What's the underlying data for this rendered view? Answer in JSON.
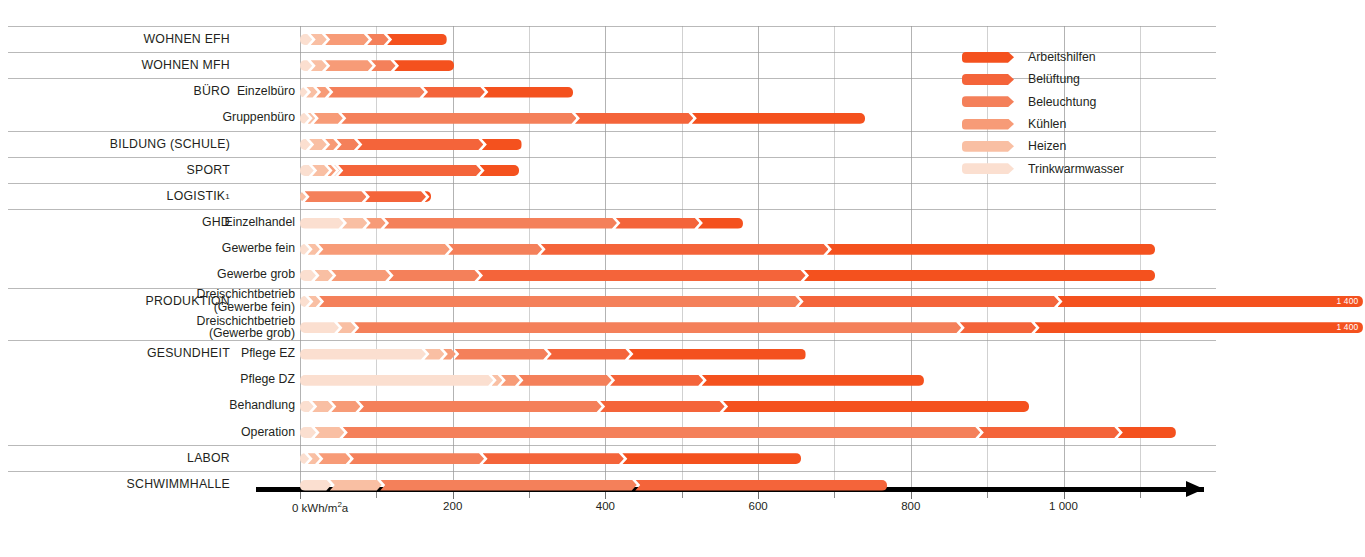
{
  "axis": {
    "unit_label": "0 kWh/m²a",
    "ticks": [
      {
        "value": 0,
        "label": "0 kWh/m²a"
      },
      {
        "value": 200,
        "label": "200"
      },
      {
        "value": 400,
        "label": "400"
      },
      {
        "value": 600,
        "label": "600"
      },
      {
        "value": 800,
        "label": "800"
      },
      {
        "value": 1000,
        "label": "1 000"
      }
    ],
    "minor_ticks": [
      100,
      300,
      500,
      700,
      900,
      1100
    ],
    "xmin": 0,
    "xmax": 1180
  },
  "legend": {
    "position": "top-right",
    "items": [
      {
        "label": "Arbeitshilfen",
        "color": "#f4511e"
      },
      {
        "label": "Belüftung",
        "color": "#f4643a"
      },
      {
        "label": "Beleuchtung",
        "color": "#f4805a"
      },
      {
        "label": "Kühlen",
        "color": "#f79b77"
      },
      {
        "label": "Heizen",
        "color": "#f9bfa3"
      },
      {
        "label": "Trinkwarmwasser",
        "color": "#fbdfd0"
      }
    ]
  },
  "chart_data": {
    "type": "bar",
    "orientation": "horizontal",
    "stacked": true,
    "title": "",
    "xlabel": "0 kWh/m²a",
    "ylabel": "",
    "xlim": [
      0,
      1180
    ],
    "grid": true,
    "series": [
      {
        "name": "Trinkwarmwasser",
        "color": "#fbdfd0"
      },
      {
        "name": "Heizen",
        "color": "#f9bfa3"
      },
      {
        "name": "Kühlen",
        "color": "#f79b77"
      },
      {
        "name": "Beleuchtung",
        "color": "#f4805a"
      },
      {
        "name": "Belüftung",
        "color": "#f4643a"
      },
      {
        "name": "Arbeitshilfen",
        "color": "#f4511e"
      }
    ],
    "rows": [
      {
        "group": "WOHNEN EFH",
        "sub": "",
        "sep": true,
        "values": {
          "Trinkwarmwasser": 16,
          "Heizen": 21,
          "Kühlen": 57,
          "Beleuchtung": 28,
          "Belüftung": 0,
          "Arbeitshilfen": 78
        },
        "total": 200,
        "total_label": ""
      },
      {
        "group": "WOHNEN MFH",
        "sub": "",
        "sep": true,
        "values": {
          "Trinkwarmwasser": 16,
          "Heizen": 21,
          "Kühlen": 62,
          "Beleuchtung": 32,
          "Belüftung": 0,
          "Arbeitshilfen": 79
        },
        "total": 210,
        "total_label": ""
      },
      {
        "group": "BÜRO",
        "sub": "Einzelbüro",
        "sep": true,
        "values": {
          "Trinkwarmwasser": 10,
          "Heizen": 15,
          "Kühlen": 18,
          "Beleuchtung": 126,
          "Belüftung": 81,
          "Arbeitshilfen": 118
        },
        "total": 368,
        "total_label": ""
      },
      {
        "group": "",
        "sub": "Gruppenbüro",
        "sep": false,
        "values": {
          "Trinkwarmwasser": 12,
          "Heizen": 10,
          "Kühlen": 38,
          "Beleuchtung": 308,
          "Belüftung": 155,
          "Arbeitshilfen": 227
        },
        "total": 750,
        "total_label": ""
      },
      {
        "group": "BILDUNG (SCHULE)",
        "sub": "",
        "sep": true,
        "values": {
          "Trinkwarmwasser": 14,
          "Heizen": 23,
          "Kühlen": 17,
          "Beleuchtung": 29,
          "Belüftung": 165,
          "Arbeitshilfen": 52
        },
        "total": 300,
        "total_label": ""
      },
      {
        "group": "SPORT",
        "sub": "",
        "sep": true,
        "values": {
          "Trinkwarmwasser": 18,
          "Heizen": 22,
          "Kühlen": 11,
          "Beleuchtung": 7,
          "Belüftung": 187,
          "Arbeitshilfen": 52
        },
        "total": 297,
        "total_label": ""
      },
      {
        "group": "LOGISTIK¹",
        "sub": "",
        "sep": true,
        "values": {
          "Trinkwarmwasser": 0,
          "Heizen": 8,
          "Kühlen": 0,
          "Beleuchtung": 81,
          "Belüftung": 80,
          "Arbeitshilfen": 9
        },
        "total": 178,
        "total_label": ""
      },
      {
        "group": "GHD",
        "sub": "Einzelhandel",
        "sep": true,
        "values": {
          "Trinkwarmwasser": 57,
          "Heizen": 33,
          "Kühlen": 26,
          "Beleuchtung": 305,
          "Belüftung": 110,
          "Arbeitshilfen": 59
        },
        "total": 590,
        "total_label": ""
      },
      {
        "group": "",
        "sub": "Gewerbe fein",
        "sep": false,
        "values": {
          "Trinkwarmwasser": 12,
          "Heizen": 16,
          "Kühlen": 172,
          "Beleuchtung": 123,
          "Belüftung": 377,
          "Arbeitshilfen": 430
        },
        "total": 1130,
        "total_label": ""
      },
      {
        "group": "",
        "sub": "Gewerbe grob",
        "sep": false,
        "values": {
          "Trinkwarmwasser": 21,
          "Heizen": 24,
          "Kühlen": 77,
          "Beleuchtung": 119,
          "Belüftung": 429,
          "Arbeitshilfen": 460
        },
        "total": 1130,
        "total_label": ""
      },
      {
        "group": "PRODUKTION",
        "sub": "Dreischichtbetrieb\n(Gewerbe fein)",
        "sep": true,
        "values": {
          "Trinkwarmwasser": 13,
          "Heizen": 16,
          "Kühlen": 0,
          "Beleuchtung": 630,
          "Belüftung": 341,
          "Arbeitshilfen": 400
        },
        "total": 1400,
        "total_label": "1 400"
      },
      {
        "group": "",
        "sub": "Dreischichtbetrieb\n(Gewerbe grob)",
        "sep": false,
        "values": {
          "Trinkwarmwasser": 51,
          "Heizen": 24,
          "Kühlen": 0,
          "Beleuchtung": 795,
          "Belüftung": 100,
          "Arbeitshilfen": 430
        },
        "total": 1400,
        "total_label": "1 400"
      },
      {
        "group": "GESUNDHEIT",
        "sub": "Pflege EZ",
        "sep": true,
        "values": {
          "Trinkwarmwasser": 165,
          "Heizen": 26,
          "Kühlen": 17,
          "Beleuchtung": 123,
          "Belüftung": 109,
          "Arbeitshilfen": 232
        },
        "total": 672,
        "total_label": ""
      },
      {
        "group": "",
        "sub": "Pflege DZ",
        "sep": false,
        "values": {
          "Trinkwarmwasser": 253,
          "Heizen": 14,
          "Kühlen": 25,
          "Beleuchtung": 122,
          "Belüftung": 122,
          "Arbeitshilfen": 291
        },
        "total": 827,
        "total_label": ""
      },
      {
        "group": "",
        "sub": "Behandlung",
        "sep": false,
        "values": {
          "Trinkwarmwasser": 18,
          "Heizen": 27,
          "Kühlen": 38,
          "Beleuchtung": 318,
          "Belüftung": 163,
          "Arbeitshilfen": 401
        },
        "total": 965,
        "total_label": ""
      },
      {
        "group": "",
        "sub": "Operation",
        "sep": false,
        "values": {
          "Trinkwarmwasser": 21,
          "Heizen": 39,
          "Kühlen": 0,
          "Beleuchtung": 835,
          "Belüftung": 184,
          "Arbeitshilfen": 76
        },
        "total": 1155,
        "total_label": ""
      },
      {
        "group": "LABOR",
        "sub": "",
        "sep": true,
        "values": {
          "Trinkwarmwasser": 12,
          "Heizen": 16,
          "Kühlen": 42,
          "Beleuchtung": 177,
          "Belüftung": 185,
          "Arbeitshilfen": 234
        },
        "total": 666,
        "total_label": ""
      },
      {
        "group": "SCHWIMMHALLE",
        "sub": "",
        "sep": true,
        "values": {
          "Trinkwarmwasser": 41,
          "Heizen": 68,
          "Kühlen": 0,
          "Beleuchtung": 336,
          "Belüftung": 330,
          "Arbeitshilfen": 0
        },
        "total": 775,
        "total_label": ""
      }
    ]
  },
  "footnote": "¹"
}
